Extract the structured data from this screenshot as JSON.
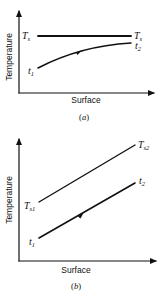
{
  "figure": {
    "panels": [
      {
        "id": "a",
        "caption_letter": "a",
        "xlabel": "Surface",
        "ylabel": "Temperature",
        "lines": [
          {
            "name": "surface-temperature",
            "label_left": "T",
            "label_left_sub": "s",
            "label_right": "T",
            "label_right_sub": "s",
            "shape": "horizontal"
          },
          {
            "name": "fluid-temperature",
            "label_left": "t",
            "label_left_sub": "1",
            "label_right": "t",
            "label_right_sub": "2",
            "shape": "concave-rising",
            "direction_arrow": true
          }
        ]
      },
      {
        "id": "b",
        "caption_letter": "b",
        "xlabel": "Surface",
        "ylabel": "Temperature",
        "lines": [
          {
            "name": "surface-temperature",
            "label_left": "T",
            "label_left_sub": "s1",
            "label_right": "T",
            "label_right_sub": "s2",
            "shape": "linear-rising"
          },
          {
            "name": "fluid-temperature",
            "label_left": "t",
            "label_left_sub": "1",
            "label_right": "t",
            "label_right_sub": "2",
            "shape": "linear-rising-parallel",
            "direction_arrow": true
          }
        ]
      }
    ],
    "paren_open": "(",
    "paren_close": ")"
  }
}
